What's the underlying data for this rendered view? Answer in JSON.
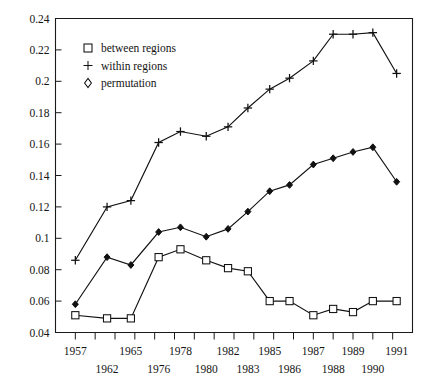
{
  "chart_data": {
    "type": "line",
    "title": "",
    "subtitle": "",
    "xlabel": "",
    "ylabel": "",
    "grid": false,
    "legend_position": "top-left",
    "ylim": [
      0.04,
      0.24
    ],
    "ytick_labels": [
      "0.24",
      "0.22",
      "0.2",
      "0.18",
      "0.16",
      "0.14",
      "0.12",
      "0.1",
      "0.08",
      "0.06",
      "0.04"
    ],
    "ytick_values": [
      0.24,
      0.22,
      0.2,
      0.18,
      0.16,
      0.14,
      0.12,
      0.1,
      0.08,
      0.06,
      0.04
    ],
    "categories": [
      "1957",
      "1962",
      "1965",
      "1976",
      "1978",
      "1980",
      "1982",
      "1983",
      "1985",
      "1986",
      "1987",
      "1988",
      "1989",
      "1990",
      "1991"
    ],
    "xtick_labels_upper": [
      "1957",
      "",
      "1965",
      "",
      "1978",
      "",
      "1982",
      "",
      "1985",
      "",
      "1987",
      "",
      "1989",
      "",
      "1991"
    ],
    "xtick_labels_lower": [
      "",
      "1962",
      "",
      "1976",
      "",
      "1980",
      "",
      "1983",
      "",
      "1986",
      "",
      "1988",
      "",
      "1990",
      ""
    ],
    "series": [
      {
        "name": "between regions",
        "marker": "square",
        "values": [
          0.051,
          0.049,
          0.049,
          0.088,
          0.093,
          0.086,
          0.081,
          0.079,
          0.06,
          0.06,
          0.051,
          0.055,
          0.053,
          0.06,
          0.06
        ]
      },
      {
        "name": "within regions",
        "marker": "plus",
        "values": [
          0.086,
          0.12,
          0.124,
          0.161,
          0.168,
          0.165,
          0.171,
          0.183,
          0.195,
          0.202,
          0.213,
          0.23,
          0.23,
          0.231,
          0.205
        ]
      },
      {
        "name": "permutation",
        "marker": "diamond",
        "values": [
          0.058,
          0.088,
          0.083,
          0.104,
          0.107,
          0.101,
          0.106,
          0.117,
          0.13,
          0.134,
          0.147,
          0.151,
          0.155,
          0.158,
          0.136
        ]
      }
    ],
    "legend": [
      {
        "label": "between regions",
        "marker": "square"
      },
      {
        "label": "within regions",
        "marker": "plus"
      },
      {
        "label": "permutation",
        "marker": "diamond"
      }
    ],
    "colors": {
      "axis": "#1a1a1a",
      "line": "#111111",
      "text": "#141414",
      "background": "#ffffff"
    }
  }
}
